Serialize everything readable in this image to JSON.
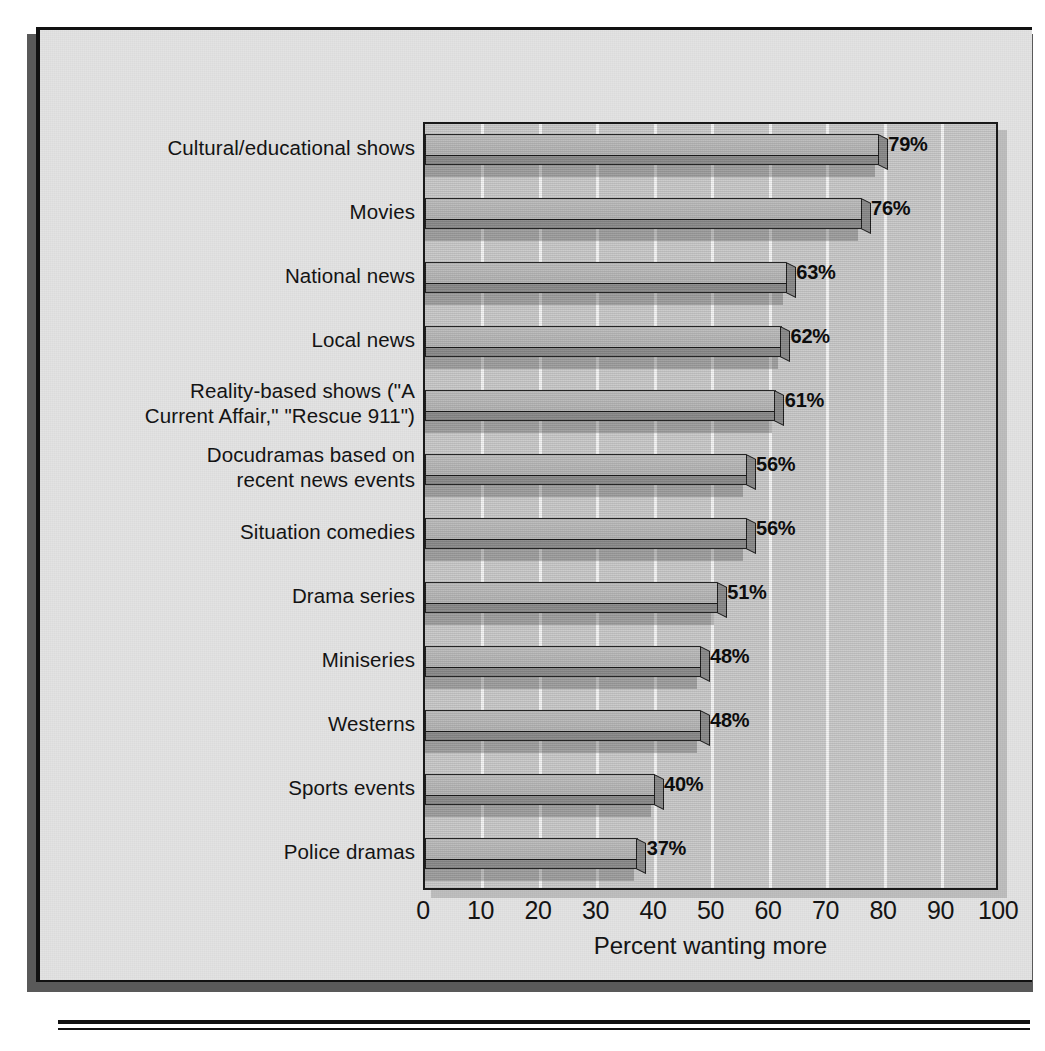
{
  "chart_data": {
    "type": "bar",
    "orientation": "horizontal",
    "title": "",
    "xlabel": "Percent wanting more",
    "ylabel": "",
    "xlim": [
      0,
      100
    ],
    "xticks": [
      "0",
      "10",
      "20",
      "30",
      "40",
      "50",
      "60",
      "70",
      "80",
      "90",
      "100"
    ],
    "grid": "vertical",
    "legend": "none",
    "categories": [
      "Cultural/educational shows",
      "Movies",
      "National news",
      "Local news",
      "Reality-based shows (\"A Current Affair,\" \"Rescue 911\")",
      "Docudramas based on recent news events",
      "Situation comedies",
      "Drama series",
      "Miniseries",
      "Westerns",
      "Sports events",
      "Police dramas"
    ],
    "category_lines": [
      [
        "Cultural/educational shows"
      ],
      [
        "Movies"
      ],
      [
        "National news"
      ],
      [
        "Local news"
      ],
      [
        "Reality-based shows (\"A",
        "Current Affair,\" \"Rescue 911\")"
      ],
      [
        "Docudramas based on",
        "recent news events"
      ],
      [
        "Situation comedies"
      ],
      [
        "Drama series"
      ],
      [
        "Miniseries"
      ],
      [
        "Westerns"
      ],
      [
        "Sports events"
      ],
      [
        "Police dramas"
      ]
    ],
    "values": [
      79,
      76,
      63,
      62,
      61,
      56,
      56,
      51,
      48,
      48,
      40,
      37
    ],
    "value_labels": [
      "79%",
      "76%",
      "63%",
      "62%",
      "61%",
      "56%",
      "56%",
      "51%",
      "48%",
      "48%",
      "40%",
      "37%"
    ]
  },
  "style": {
    "card_background": "#e3e3e3",
    "plot_background": "#c9c9c9",
    "gridline_color": "#f4f4f4",
    "bar_face_color": "#b8b8b8",
    "bar_edge_color": "#8a8a8a",
    "outline_color": "#1a1a1a",
    "text_color": "#141414",
    "shadow_color": "#595959"
  }
}
